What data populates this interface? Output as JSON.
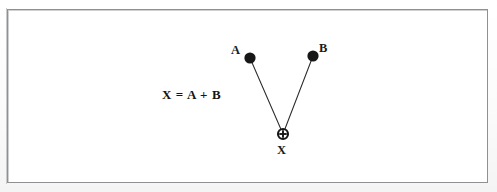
{
  "figure": {
    "kind": "vector-addition-diagram",
    "background_color": "#ffffff",
    "frame_border_color": "#8e9094",
    "ink_color": "#1b1b1b",
    "equation": "X = A + B",
    "nodes": [
      {
        "id": "A",
        "label": "A",
        "glyph": "filled-circle",
        "x": 250,
        "y": 58,
        "radius": 5.6,
        "label_x": 231,
        "label_y": 44
      },
      {
        "id": "B",
        "label": "B",
        "glyph": "filled-circle",
        "x": 313,
        "y": 56,
        "radius": 5.6,
        "label_x": 319,
        "label_y": 42
      },
      {
        "id": "X",
        "label": "X",
        "glyph": "circle-plus",
        "x": 283,
        "y": 134,
        "radius": 5.0,
        "label_x": 277,
        "label_y": 144
      }
    ],
    "edges": [
      {
        "id": "edge-a-x",
        "from": "A",
        "to": "X",
        "x1": 250,
        "y1": 58,
        "x2": 283,
        "y2": 134
      },
      {
        "id": "edge-b-x",
        "from": "B",
        "to": "X",
        "x1": 313,
        "y1": 56,
        "x2": 283,
        "y2": 134
      }
    ],
    "frame": {
      "x": 7,
      "y": 9,
      "width": 481,
      "height": 174
    }
  }
}
